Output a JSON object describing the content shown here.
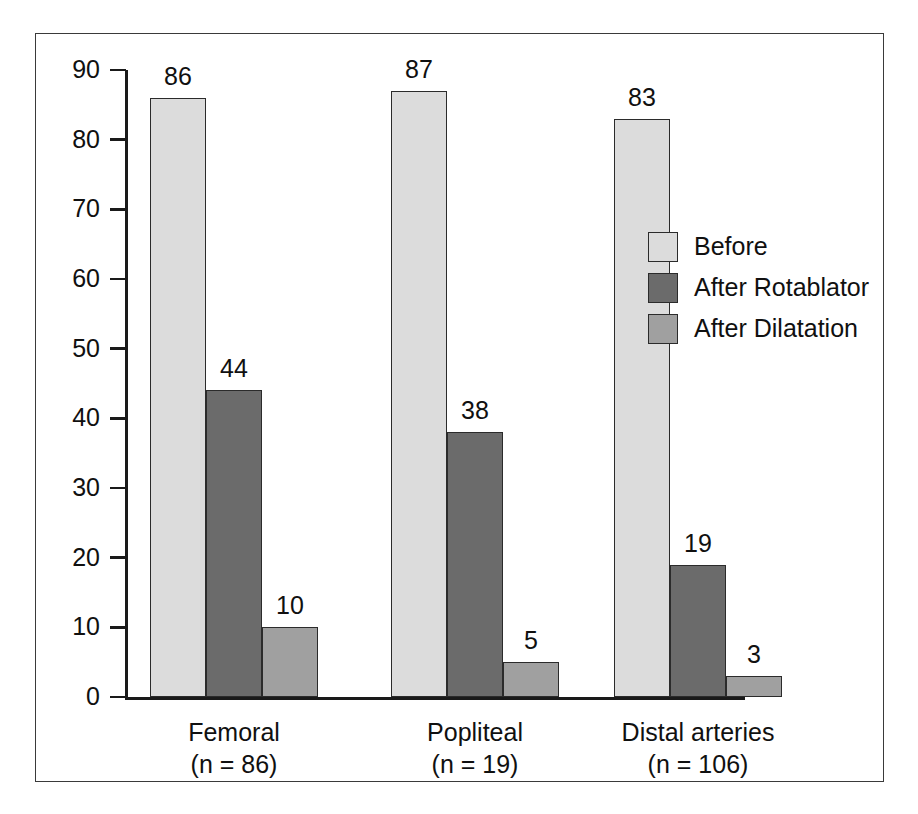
{
  "chart_data": {
    "type": "bar",
    "title": "",
    "subtitle": "",
    "xlabel": "",
    "ylabel": "",
    "ylim": [
      0,
      90
    ],
    "yticks": [
      0,
      10,
      20,
      30,
      40,
      50,
      60,
      70,
      80,
      90
    ],
    "ytick_labels": [
      "0",
      "10",
      "20",
      "30",
      "40",
      "50",
      "60",
      "70",
      "80",
      "90"
    ],
    "grid": false,
    "legend_position": "right",
    "categories": [
      "Femoral",
      "Popliteal",
      "Distal arteries"
    ],
    "category_sublabels": [
      "(n = 86)",
      "(n = 19)",
      "(n = 106)"
    ],
    "series": [
      {
        "name": "Before",
        "color": "#dcdcdc",
        "values": [
          86,
          87,
          83
        ],
        "value_labels": [
          "86",
          "87",
          "83"
        ]
      },
      {
        "name": "After Rotablator",
        "color": "#6b6b6b",
        "values": [
          44,
          38,
          19
        ],
        "value_labels": [
          "44",
          "38",
          "19"
        ]
      },
      {
        "name": "After Dilatation",
        "color": "#a0a0a0",
        "values": [
          10,
          5,
          3
        ],
        "value_labels": [
          "10",
          "5",
          "3"
        ]
      }
    ]
  },
  "legend": {
    "items": [
      {
        "label": "Before",
        "color": "#dcdcdc"
      },
      {
        "label": "After Rotablator",
        "color": "#6b6b6b"
      },
      {
        "label": "After Dilatation",
        "color": "#a0a0a0"
      }
    ]
  },
  "axis": {
    "y_tick_labels": [
      "90",
      "80",
      "70",
      "60",
      "50",
      "40",
      "30",
      "20",
      "10",
      "0"
    ]
  },
  "groups": [
    {
      "label": "Femoral",
      "sublabel": "(n = 86)"
    },
    {
      "label": "Popliteal",
      "sublabel": "(n = 19)"
    },
    {
      "label": "Distal arteries",
      "sublabel": "(n = 106)"
    }
  ],
  "colors": {
    "before": "#dcdcdc",
    "after_rotablator": "#6b6b6b",
    "after_dilatation": "#a0a0a0",
    "axis": "#1a1a1a",
    "frame": "#3a3a3a",
    "text": "#101010",
    "background": "#ffffff"
  }
}
